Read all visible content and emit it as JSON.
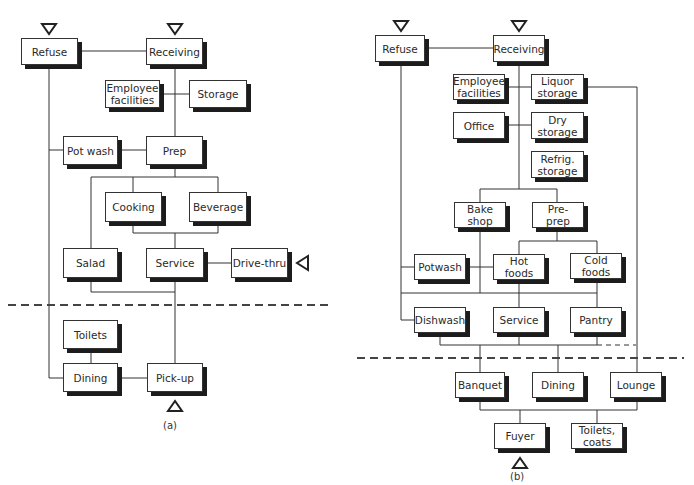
{
  "diagram_a": {
    "caption": "(a)",
    "nodes": {
      "refuse": "Refuse",
      "receiving": "Receiving",
      "employee_facilities": "Employee\nfacilities",
      "storage": "Storage",
      "pot_wash": "Pot wash",
      "prep": "Prep",
      "cooking": "Cooking",
      "beverage": "Beverage",
      "salad": "Salad",
      "service": "Service",
      "drive_thru": "Drive-thru",
      "toilets": "Toilets",
      "dining": "Dining",
      "pick_up": "Pick-up"
    },
    "entry_points": [
      "refuse",
      "receiving",
      "drive_thru",
      "pick_up"
    ]
  },
  "diagram_b": {
    "caption": "(b)",
    "nodes": {
      "refuse": "Refuse",
      "receiving": "Receiving",
      "employee_facilities": "Employee\nfacilities",
      "liquor_storage": "Liquor\nstorage",
      "office": "Office",
      "dry_storage": "Dry\nstorage",
      "refrig_storage": "Refrig.\nstorage",
      "bake_shop": "Bake\nshop",
      "pre_prep": "Pre-\nprep",
      "potwash": "Potwash",
      "hot_foods": "Hot\nfoods",
      "cold_foods": "Cold\nfoods",
      "dishwash": "Dishwash",
      "service": "Service",
      "pantry": "Pantry",
      "banquet": "Banquet",
      "dining": "Dining",
      "lounge": "Lounge",
      "foyer": "Fuyer",
      "toilets_coats": "Toilets,\ncoats"
    },
    "entry_points": [
      "refuse",
      "receiving",
      "foyer"
    ]
  }
}
